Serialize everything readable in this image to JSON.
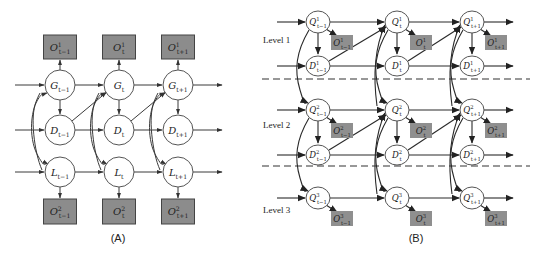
{
  "panel_a": {
    "caption": "(A)",
    "columns": [
      {
        "index": "t-1",
        "x": 60
      },
      {
        "index": "t",
        "x": 119
      },
      {
        "index": "t+1",
        "x": 178
      }
    ],
    "rows": [
      {
        "var": "G",
        "y": 85
      },
      {
        "var": "D",
        "y": 130
      },
      {
        "var": "L",
        "y": 172
      }
    ],
    "top_obs": {
      "var": "O",
      "sup": "1",
      "y": 35,
      "h": 24,
      "w": 33
    },
    "bottom_obs": {
      "var": "O",
      "sup": "2",
      "y": 199,
      "h": 25,
      "w": 33
    },
    "node_radius": 15,
    "arrow_start_x": 15,
    "arrow_end_x": 222,
    "labels": {
      "G": [
        "G_{t-1}",
        "G_t",
        "G_{t+1}"
      ],
      "D": [
        "D_{t-1}",
        "D_t",
        "D_{t+1}"
      ],
      "L": [
        "L_{t-1}",
        "L_t",
        "L_{t+1}"
      ],
      "O_top": [
        "O_{t-1}^1",
        "O_t^1",
        "O_{t+1}^1"
      ],
      "O_bottom": [
        "O_{t-1}^2",
        "O_t^2",
        "O_{t+1}^2"
      ]
    }
  },
  "panel_b": {
    "caption": "(B)",
    "columns": [
      {
        "index": "t-1",
        "x": 318
      },
      {
        "index": "t",
        "x": 397
      },
      {
        "index": "t+1",
        "x": 472
      }
    ],
    "levels": [
      {
        "label": "Level 1",
        "level": "1",
        "q_y": 22,
        "d_y": 66,
        "label_y": 43,
        "has_d": true
      },
      {
        "label": "Level 2",
        "level": "2",
        "q_y": 110,
        "d_y": 155,
        "label_y": 128,
        "has_d": true
      },
      {
        "label": "Level 3",
        "level": "3",
        "q_y": 198,
        "d_y": null,
        "label_y": 213,
        "has_d": false
      }
    ],
    "dashed_separators_y": [
      79,
      166
    ],
    "node_rx": 12,
    "node_ry": 11,
    "arrow_start_x": 277,
    "arrow_end_x": 513,
    "dash_start_x": 262,
    "dash_end_x": 530,
    "labels": {
      "level1": {
        "Q": [
          "Q_{t-1}^1",
          "Q_t^1",
          "Q_{t+1}^1"
        ],
        "D": [
          "D_{t-1}^1",
          "D_t^1",
          "D_{t+1}^1"
        ],
        "O": [
          "O_{t-1}^1",
          "O_t^1",
          "O_{t+1}^1"
        ]
      },
      "level2": {
        "Q": [
          "Q_{t-1}^2",
          "Q_t^2",
          "Q_{t+1}^2"
        ],
        "D": [
          "D_{t-1}^2",
          "D_t^2",
          "D_{t+1}^2"
        ],
        "O": [
          "O_{t-1}^2",
          "O_t^2",
          "O_{t+1}^2"
        ]
      },
      "level3": {
        "Q": [
          "Q_{t-1}^3",
          "Q_t^3",
          "Q_{t+1}^3"
        ],
        "O": [
          "O_{t-1}^3",
          "O_t^3",
          "O_{t+1}^3"
        ]
      }
    }
  },
  "colors": {
    "observation_fill": "#8c8c8c",
    "node_fill": "#ffffff",
    "edge": "#3a3a3a"
  }
}
